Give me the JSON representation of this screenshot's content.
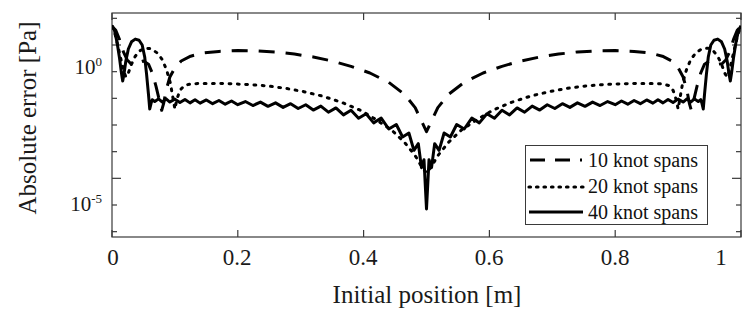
{
  "chart_data": {
    "type": "line",
    "title": "",
    "xlabel": "Initial position [m]",
    "ylabel": "Absolute error [Pa]",
    "xlim": [
      0,
      1
    ],
    "ylim_log10": [
      -7.2,
      1.2
    ],
    "yscale": "log",
    "xticks": [
      0,
      0.2,
      0.4,
      0.6,
      0.8,
      1
    ],
    "xticklabels": [
      "0",
      "0.2",
      "0.4",
      "0.6",
      "0.8",
      "1"
    ],
    "yticks_log10": [
      0,
      -5
    ],
    "yticklabels": [
      "10",
      "10"
    ],
    "ytick_exponents": [
      "0",
      "-5"
    ],
    "grid": false,
    "legend_position": "lower right",
    "series": [
      {
        "name": "10 knot spans",
        "style": "dashed",
        "color": "#000000",
        "points_log10": [
          [
            0.0,
            0.7
          ],
          [
            0.006,
            0.55
          ],
          [
            0.012,
            0.2
          ],
          [
            0.018,
            -0.25
          ],
          [
            0.024,
            -0.55
          ],
          [
            0.03,
            -0.7
          ],
          [
            0.036,
            -0.72
          ],
          [
            0.042,
            -0.66
          ],
          [
            0.05,
            -0.6
          ],
          [
            0.058,
            -0.72
          ],
          [
            0.064,
            -1.05
          ],
          [
            0.07,
            -1.55
          ],
          [
            0.075,
            -2.05
          ],
          [
            0.079,
            -2.45
          ],
          [
            0.082,
            -2.2
          ],
          [
            0.086,
            -1.7
          ],
          [
            0.092,
            -1.2
          ],
          [
            0.1,
            -0.85
          ],
          [
            0.11,
            -0.6
          ],
          [
            0.125,
            -0.42
          ],
          [
            0.145,
            -0.3
          ],
          [
            0.17,
            -0.24
          ],
          [
            0.2,
            -0.21
          ],
          [
            0.23,
            -0.22
          ],
          [
            0.26,
            -0.26
          ],
          [
            0.29,
            -0.34
          ],
          [
            0.32,
            -0.45
          ],
          [
            0.35,
            -0.6
          ],
          [
            0.38,
            -0.8
          ],
          [
            0.41,
            -1.05
          ],
          [
            0.44,
            -1.4
          ],
          [
            0.465,
            -1.85
          ],
          [
            0.482,
            -2.35
          ],
          [
            0.494,
            -2.95
          ],
          [
            0.5,
            -3.25
          ],
          [
            0.506,
            -2.95
          ],
          [
            0.518,
            -2.35
          ],
          [
            0.535,
            -1.85
          ],
          [
            0.56,
            -1.4
          ],
          [
            0.59,
            -1.05
          ],
          [
            0.62,
            -0.8
          ],
          [
            0.65,
            -0.6
          ],
          [
            0.68,
            -0.45
          ],
          [
            0.71,
            -0.34
          ],
          [
            0.74,
            -0.26
          ],
          [
            0.77,
            -0.22
          ],
          [
            0.8,
            -0.21
          ],
          [
            0.83,
            -0.24
          ],
          [
            0.855,
            -0.3
          ],
          [
            0.875,
            -0.42
          ],
          [
            0.89,
            -0.6
          ],
          [
            0.9,
            -0.85
          ],
          [
            0.908,
            -1.2
          ],
          [
            0.914,
            -1.7
          ],
          [
            0.918,
            -2.2
          ],
          [
            0.921,
            -2.45
          ],
          [
            0.925,
            -2.05
          ],
          [
            0.93,
            -1.55
          ],
          [
            0.936,
            -1.05
          ],
          [
            0.942,
            -0.72
          ],
          [
            0.95,
            -0.6
          ],
          [
            0.958,
            -0.66
          ],
          [
            0.964,
            -0.72
          ],
          [
            0.97,
            -0.7
          ],
          [
            0.976,
            -0.55
          ],
          [
            0.982,
            -0.25
          ],
          [
            0.988,
            0.2
          ],
          [
            0.994,
            0.55
          ],
          [
            1.0,
            0.7
          ]
        ]
      },
      {
        "name": "20 knot spans",
        "style": "dotted",
        "color": "#000000",
        "points_log10": [
          [
            0.0,
            0.7
          ],
          [
            0.005,
            0.4
          ],
          [
            0.01,
            -0.1
          ],
          [
            0.015,
            -0.62
          ],
          [
            0.019,
            -1.0
          ],
          [
            0.022,
            -1.2
          ],
          [
            0.026,
            -1.05
          ],
          [
            0.031,
            -0.72
          ],
          [
            0.037,
            -0.42
          ],
          [
            0.044,
            -0.22
          ],
          [
            0.052,
            -0.12
          ],
          [
            0.062,
            -0.14
          ],
          [
            0.072,
            -0.3
          ],
          [
            0.08,
            -0.55
          ],
          [
            0.087,
            -0.95
          ],
          [
            0.093,
            -1.45
          ],
          [
            0.097,
            -2.0
          ],
          [
            0.1,
            -2.4
          ],
          [
            0.103,
            -2.05
          ],
          [
            0.108,
            -1.7
          ],
          [
            0.115,
            -1.52
          ],
          [
            0.125,
            -1.46
          ],
          [
            0.14,
            -1.44
          ],
          [
            0.16,
            -1.44
          ],
          [
            0.185,
            -1.45
          ],
          [
            0.215,
            -1.48
          ],
          [
            0.245,
            -1.53
          ],
          [
            0.275,
            -1.62
          ],
          [
            0.305,
            -1.75
          ],
          [
            0.335,
            -1.92
          ],
          [
            0.365,
            -2.15
          ],
          [
            0.395,
            -2.45
          ],
          [
            0.42,
            -2.8
          ],
          [
            0.445,
            -3.2
          ],
          [
            0.465,
            -3.65
          ],
          [
            0.482,
            -4.15
          ],
          [
            0.492,
            -4.55
          ],
          [
            0.5,
            -4.8
          ],
          [
            0.508,
            -4.55
          ],
          [
            0.518,
            -4.15
          ],
          [
            0.535,
            -3.65
          ],
          [
            0.555,
            -3.2
          ],
          [
            0.58,
            -2.8
          ],
          [
            0.605,
            -2.45
          ],
          [
            0.635,
            -2.15
          ],
          [
            0.665,
            -1.92
          ],
          [
            0.695,
            -1.75
          ],
          [
            0.725,
            -1.62
          ],
          [
            0.755,
            -1.53
          ],
          [
            0.785,
            -1.48
          ],
          [
            0.815,
            -1.45
          ],
          [
            0.84,
            -1.44
          ],
          [
            0.86,
            -1.44
          ],
          [
            0.875,
            -1.46
          ],
          [
            0.885,
            -1.52
          ],
          [
            0.892,
            -1.7
          ],
          [
            0.897,
            -2.05
          ],
          [
            0.9,
            -2.4
          ],
          [
            0.903,
            -2.0
          ],
          [
            0.907,
            -1.45
          ],
          [
            0.913,
            -0.95
          ],
          [
            0.92,
            -0.55
          ],
          [
            0.928,
            -0.3
          ],
          [
            0.938,
            -0.14
          ],
          [
            0.948,
            -0.12
          ],
          [
            0.956,
            -0.22
          ],
          [
            0.963,
            -0.42
          ],
          [
            0.969,
            -0.72
          ],
          [
            0.974,
            -1.05
          ],
          [
            0.978,
            -1.2
          ],
          [
            0.981,
            -1.0
          ],
          [
            0.985,
            -0.62
          ],
          [
            0.99,
            -0.1
          ],
          [
            0.995,
            0.4
          ],
          [
            1.0,
            0.7
          ]
        ]
      },
      {
        "name": "40 knot spans",
        "style": "solid",
        "color": "#000000",
        "points_log10": [
          [
            0.0,
            0.72
          ],
          [
            0.004,
            0.55
          ],
          [
            0.008,
            0.1
          ],
          [
            0.012,
            -0.5
          ],
          [
            0.015,
            -1.05
          ],
          [
            0.017,
            -1.35
          ],
          [
            0.019,
            -1.1
          ],
          [
            0.022,
            -0.6
          ],
          [
            0.026,
            -0.15
          ],
          [
            0.031,
            0.12
          ],
          [
            0.037,
            0.22
          ],
          [
            0.043,
            0.18
          ],
          [
            0.048,
            0.0
          ],
          [
            0.052,
            -0.45
          ],
          [
            0.055,
            -1.1
          ],
          [
            0.058,
            -1.85
          ],
          [
            0.06,
            -2.4
          ],
          [
            0.062,
            -2.2
          ],
          [
            0.064,
            -2.05
          ],
          [
            0.068,
            -2.12
          ],
          [
            0.074,
            -2.02
          ],
          [
            0.08,
            -2.14
          ],
          [
            0.086,
            -2.02
          ],
          [
            0.092,
            -2.14
          ],
          [
            0.1,
            -2.03
          ],
          [
            0.108,
            -2.16
          ],
          [
            0.116,
            -2.04
          ],
          [
            0.124,
            -2.17
          ],
          [
            0.132,
            -2.05
          ],
          [
            0.14,
            -2.18
          ],
          [
            0.15,
            -2.06
          ],
          [
            0.16,
            -2.2
          ],
          [
            0.17,
            -2.08
          ],
          [
            0.18,
            -2.22
          ],
          [
            0.19,
            -2.1
          ],
          [
            0.2,
            -2.24
          ],
          [
            0.212,
            -2.12
          ],
          [
            0.224,
            -2.27
          ],
          [
            0.236,
            -2.14
          ],
          [
            0.248,
            -2.3
          ],
          [
            0.26,
            -2.17
          ],
          [
            0.272,
            -2.34
          ],
          [
            0.284,
            -2.2
          ],
          [
            0.296,
            -2.38
          ],
          [
            0.308,
            -2.24
          ],
          [
            0.32,
            -2.44
          ],
          [
            0.332,
            -2.29
          ],
          [
            0.344,
            -2.52
          ],
          [
            0.356,
            -2.36
          ],
          [
            0.368,
            -2.62
          ],
          [
            0.38,
            -2.45
          ],
          [
            0.392,
            -2.75
          ],
          [
            0.404,
            -2.58
          ],
          [
            0.416,
            -2.92
          ],
          [
            0.428,
            -2.74
          ],
          [
            0.44,
            -3.15
          ],
          [
            0.452,
            -2.98
          ],
          [
            0.462,
            -3.45
          ],
          [
            0.472,
            -3.3
          ],
          [
            0.48,
            -3.95
          ],
          [
            0.487,
            -3.7
          ],
          [
            0.492,
            -4.6
          ],
          [
            0.496,
            -4.3
          ],
          [
            0.5,
            -6.15
          ],
          [
            0.504,
            -4.3
          ],
          [
            0.508,
            -4.6
          ],
          [
            0.513,
            -3.7
          ],
          [
            0.52,
            -3.95
          ],
          [
            0.528,
            -3.3
          ],
          [
            0.538,
            -3.45
          ],
          [
            0.548,
            -2.98
          ],
          [
            0.56,
            -3.15
          ],
          [
            0.572,
            -2.74
          ],
          [
            0.584,
            -2.92
          ],
          [
            0.596,
            -2.58
          ],
          [
            0.608,
            -2.75
          ],
          [
            0.62,
            -2.45
          ],
          [
            0.632,
            -2.62
          ],
          [
            0.644,
            -2.36
          ],
          [
            0.656,
            -2.52
          ],
          [
            0.668,
            -2.29
          ],
          [
            0.68,
            -2.44
          ],
          [
            0.692,
            -2.24
          ],
          [
            0.704,
            -2.38
          ],
          [
            0.716,
            -2.2
          ],
          [
            0.728,
            -2.34
          ],
          [
            0.74,
            -2.17
          ],
          [
            0.752,
            -2.3
          ],
          [
            0.764,
            -2.14
          ],
          [
            0.776,
            -2.27
          ],
          [
            0.788,
            -2.12
          ],
          [
            0.8,
            -2.24
          ],
          [
            0.81,
            -2.1
          ],
          [
            0.82,
            -2.22
          ],
          [
            0.83,
            -2.08
          ],
          [
            0.84,
            -2.2
          ],
          [
            0.85,
            -2.06
          ],
          [
            0.86,
            -2.18
          ],
          [
            0.868,
            -2.05
          ],
          [
            0.876,
            -2.17
          ],
          [
            0.884,
            -2.04
          ],
          [
            0.892,
            -2.16
          ],
          [
            0.9,
            -2.03
          ],
          [
            0.908,
            -2.14
          ],
          [
            0.914,
            -2.02
          ],
          [
            0.92,
            -2.14
          ],
          [
            0.926,
            -2.02
          ],
          [
            0.932,
            -2.12
          ],
          [
            0.936,
            -2.05
          ],
          [
            0.938,
            -2.2
          ],
          [
            0.94,
            -2.4
          ],
          [
            0.942,
            -1.85
          ],
          [
            0.945,
            -1.1
          ],
          [
            0.948,
            -0.45
          ],
          [
            0.952,
            0.0
          ],
          [
            0.957,
            0.18
          ],
          [
            0.963,
            0.22
          ],
          [
            0.969,
            0.12
          ],
          [
            0.974,
            -0.15
          ],
          [
            0.978,
            -0.6
          ],
          [
            0.981,
            -1.1
          ],
          [
            0.983,
            -1.35
          ],
          [
            0.985,
            -1.05
          ],
          [
            0.988,
            -0.5
          ],
          [
            0.992,
            0.1
          ],
          [
            0.996,
            0.55
          ],
          [
            1.0,
            0.72
          ]
        ]
      }
    ]
  },
  "legend": {
    "items": [
      {
        "label": "10 knot spans",
        "style": "dashed"
      },
      {
        "label": "20 knot spans",
        "style": "dotted"
      },
      {
        "label": "40 knot spans",
        "style": "solid"
      }
    ]
  },
  "axes": {
    "ytick0_mantissa": "10",
    "ytick0_exp": "0",
    "ytick1_mantissa": "10",
    "ytick1_exp": "-5"
  },
  "colors": {
    "axis": "#3a3a3a",
    "line": "#000000",
    "background": "#ffffff"
  }
}
